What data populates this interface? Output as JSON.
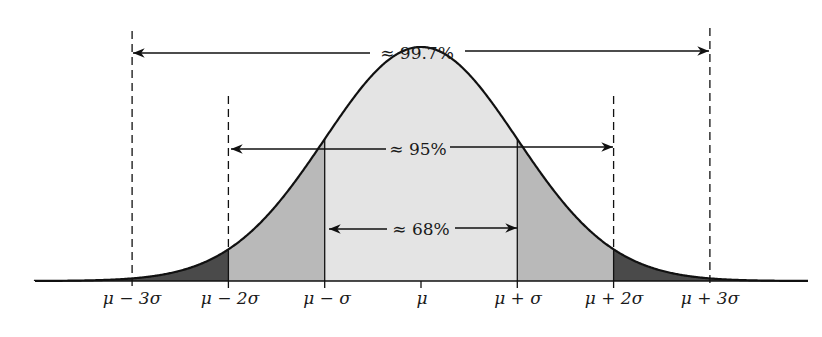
{
  "diagram": {
    "colors": {
      "center_band": "#e4e4e4",
      "one_to_two_sigma": "#b9b9b9",
      "two_to_three_sigma": "#4a4a4a",
      "curve": "#111111"
    },
    "annotations": [
      {
        "text": "≈ 99.7%",
        "from": "μ − 3σ",
        "to": "μ + 3σ"
      },
      {
        "text": "≈ 95%",
        "from": "μ − 2σ",
        "to": "μ + 2σ"
      },
      {
        "text": "≈ 68%",
        "from": "μ − σ",
        "to": "μ + σ"
      }
    ],
    "axis_ticks": [
      {
        "label": "μ − 3σ"
      },
      {
        "label": "μ − 2σ"
      },
      {
        "label": "μ − σ"
      },
      {
        "label": "μ"
      },
      {
        "label": "μ + σ"
      },
      {
        "label": "μ + 2σ"
      },
      {
        "label": "μ + 3σ"
      }
    ]
  }
}
